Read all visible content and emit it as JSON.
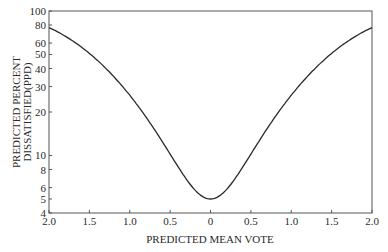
{
  "chart_data": {
    "type": "line",
    "title": "",
    "xlabel": "PREDICTED MEAN VOTE",
    "ylabel_lines": [
      "PREDICTED PERCENT",
      "DISSATISFIED(PPD)"
    ],
    "ylabel": "PREDICTED PERCENT DISSATISFIED(PPD)",
    "yscale": "log",
    "xlim": [
      -2.0,
      2.0
    ],
    "ylim": [
      4,
      100
    ],
    "grid": false,
    "legend": null,
    "x_tick_labels": [
      "2.0",
      "1.5",
      "1.0",
      "0.5",
      "0",
      "0.5",
      "1.0",
      "1.5",
      "2.0"
    ],
    "x_tick_values": [
      -2.0,
      -1.5,
      -1.0,
      -0.5,
      0,
      0.5,
      1.0,
      1.5,
      2.0
    ],
    "y_tick_labels": [
      "100",
      "80",
      "60",
      "50",
      "40",
      "30",
      "20",
      "10",
      "8",
      "6",
      "5",
      "4"
    ],
    "y_tick_values": [
      100,
      80,
      60,
      50,
      40,
      30,
      20,
      10,
      8,
      6,
      5,
      4
    ],
    "series": [
      {
        "name": "PPD",
        "x": [
          -2.0,
          -1.75,
          -1.5,
          -1.25,
          -1.0,
          -0.75,
          -0.5,
          -0.25,
          0,
          0.25,
          0.5,
          0.75,
          1.0,
          1.25,
          1.5,
          1.75,
          2.0
        ],
        "y": [
          77,
          65,
          51,
          37,
          26,
          17,
          10,
          6.3,
          5,
          6.3,
          10,
          17,
          26,
          37,
          51,
          65,
          77
        ]
      }
    ]
  },
  "colors": {
    "line": "#2a2a2a",
    "axis": "#555555"
  }
}
